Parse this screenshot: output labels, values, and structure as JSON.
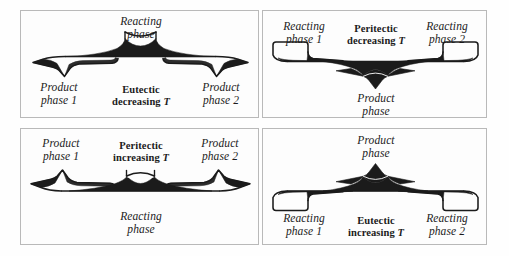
{
  "figure": {
    "type": "diagram",
    "background_color": "#fefefe",
    "line_color": "#1b1b1b",
    "border_color": "#b9b9b9"
  },
  "panels": [
    {
      "id": "top-left",
      "reaction": "Eutectic decreasing T",
      "center_label_line1": "Eutectic",
      "center_label_line2": "decreasing ",
      "center_label_symbol": "T",
      "top_label_line1": "Reacting",
      "top_label_line2": "phase",
      "left_label_line1": "Product",
      "left_label_line2": "phase 1",
      "right_label_line1": "Product",
      "right_label_line2": "phase 2",
      "arrow_direction": "outward-down",
      "source_position": "top-center",
      "product_count": 2
    },
    {
      "id": "top-right",
      "reaction": "Peritectic decreasing T",
      "center_label_line1": "Peritectic",
      "center_label_line2": "decreasing ",
      "center_label_symbol": "T",
      "bottom_label_line1": "Product",
      "bottom_label_line2": "phase",
      "left_label_line1": "Reacting",
      "left_label_line2": "phase 1",
      "right_label_line1": "Reacting",
      "right_label_line2": "phase 2",
      "arrow_direction": "inward-down",
      "source_position": "bottom-center",
      "product_count": 1
    },
    {
      "id": "bottom-left",
      "reaction": "Peritectic increasing T",
      "center_label_line1": "Peritectic",
      "center_label_line2": "increasing ",
      "center_label_symbol": "T",
      "bottom_label_line1": "Reacting",
      "bottom_label_line2": "phase",
      "left_label_line1": "Product",
      "left_label_line2": "phase 1",
      "right_label_line1": "Product",
      "right_label_line2": "phase 2",
      "arrow_direction": "outward-up",
      "source_position": "bottom-center",
      "product_count": 2
    },
    {
      "id": "bottom-right",
      "reaction": "Eutectic increasing T",
      "center_label_line1": "Eutectic",
      "center_label_line2": "increasing ",
      "center_label_symbol": "T",
      "top_label_line1": "Product",
      "top_label_line2": "phase",
      "left_label_line1": "Reacting",
      "left_label_line2": "phase 1",
      "right_label_line1": "Reacting",
      "right_label_line2": "phase 2",
      "arrow_direction": "inward-up",
      "source_position": "top-center",
      "product_count": 1
    }
  ]
}
